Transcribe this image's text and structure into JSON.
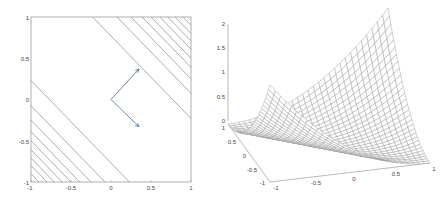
{
  "chart_data": [
    {
      "type": "contour",
      "title": "",
      "xlabel": "",
      "ylabel": "",
      "xlim": [
        -1,
        1
      ],
      "ylim": [
        -1,
        1
      ],
      "xticks": [
        "-1",
        "-0.5",
        "0",
        "0.5",
        "1"
      ],
      "yticks": [
        "-1",
        "-0.5",
        "0",
        "0.5",
        "1"
      ],
      "xtick_values": [
        -1,
        -0.5,
        0,
        0.5,
        1
      ],
      "ytick_values": [
        -1,
        -0.5,
        0,
        0.5,
        1
      ],
      "grid": false,
      "contour_lines_x_plus_y": [
        -1.9,
        -1.8,
        -1.71,
        -1.61,
        -1.5,
        -1.39,
        -1.25,
        -1.075,
        -0.77,
        0.77,
        1.075,
        1.25,
        1.39,
        1.5,
        1.61,
        1.71,
        1.8,
        1.9
      ],
      "contour_color": "#8a8a8a",
      "vectors": [
        {
          "from": [
            0,
            0
          ],
          "to": [
            0.35,
            0.37
          ]
        },
        {
          "from": [
            0,
            0
          ],
          "to": [
            0.35,
            -0.33
          ]
        }
      ],
      "vector_color": "#5b7fa6"
    },
    {
      "type": "surface_mesh",
      "title": "",
      "xlim": [
        -1,
        1
      ],
      "ylim": [
        -1,
        1
      ],
      "zlim": [
        0,
        2
      ],
      "xticks": [
        "-1",
        "-0.5",
        "0",
        "0.5",
        "1"
      ],
      "yticks": [
        "-1",
        "-0.5",
        "0",
        "0.5",
        "1"
      ],
      "zticks": [
        "0",
        "0.5",
        "1",
        "1.5",
        "2"
      ],
      "xtick_values": [
        -1,
        -0.5,
        0,
        0.5,
        1
      ],
      "ytick_values": [
        -1,
        -0.5,
        0,
        0.5,
        1
      ],
      "ztick_values": [
        0,
        0.5,
        1,
        1.5,
        2
      ],
      "function": "z = (x + y)^2 / 2",
      "grid_n": 31,
      "mesh_color": "#9a9a9a"
    }
  ],
  "left_plot": {
    "xticks": [
      "-1",
      "-0.5",
      "0",
      "0.5",
      "1"
    ],
    "yticks": [
      "1",
      "0.5",
      "0",
      "-0.5",
      "-1"
    ]
  },
  "right_plot": {
    "zticks": [
      "2",
      "1.5",
      "1",
      "0.5",
      "0"
    ],
    "yticks": [
      "1",
      "0.5",
      "0",
      "-0.5",
      "-1"
    ],
    "xticks": [
      "-1",
      "-0.5",
      "0",
      "0.5",
      "1"
    ]
  }
}
